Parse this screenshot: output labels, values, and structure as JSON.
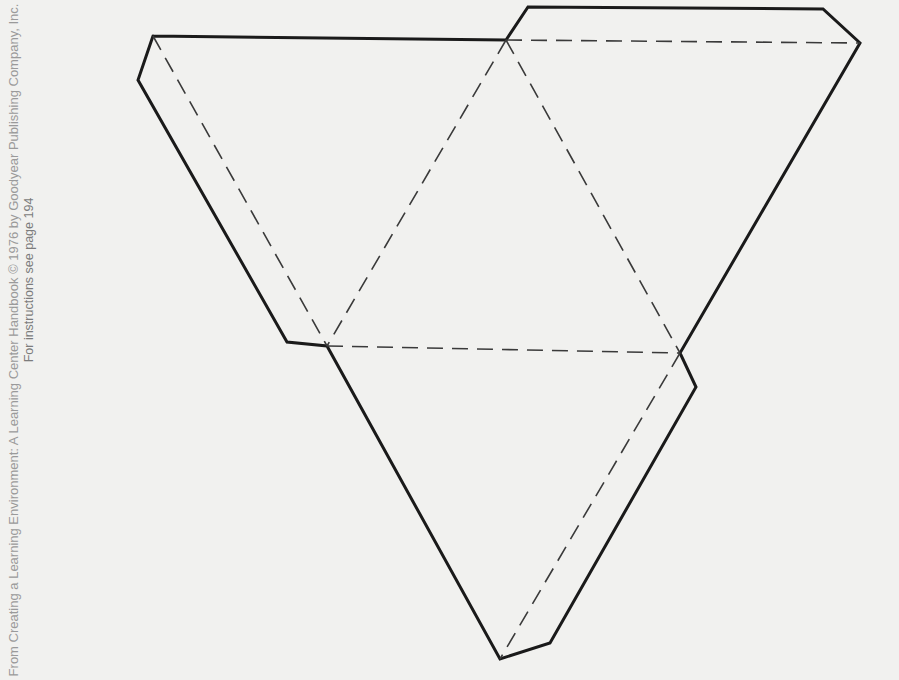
{
  "credit": {
    "line1": "From Creating a Learning Environment: A Learning Center Handbook © 1976 by Goodyear Publishing Company, Inc.",
    "line2": "For instructions see page 194"
  },
  "figure": {
    "type": "tetrahedron-net-cutout",
    "outline_color": "#1a1a1a",
    "fold_line_color": "#3a3a3a",
    "faces": 4,
    "glue_tabs": 3
  }
}
